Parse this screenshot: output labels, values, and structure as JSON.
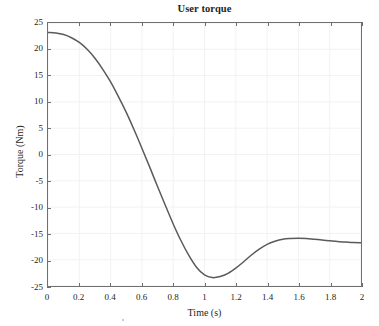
{
  "chart_data": {
    "type": "line",
    "title": "User torque",
    "xlabel": "Time (s)",
    "ylabel": "Torque (Nm)",
    "xlim": [
      0,
      2
    ],
    "ylim": [
      -25,
      25
    ],
    "grid": true,
    "legend": null,
    "line_color": "#5a5a5a",
    "line_width": 1.5,
    "xticks": [
      0,
      0.2,
      0.4,
      0.6,
      0.8,
      1,
      1.2,
      1.4,
      1.6,
      1.8,
      2
    ],
    "xtick_labels": [
      "0",
      "0.2",
      "0.4",
      "0.6",
      "0.8",
      "1",
      "1.2",
      "1.4",
      "1.6",
      "1.8",
      "2"
    ],
    "yticks": [
      25,
      20,
      15,
      10,
      5,
      0,
      -5,
      -10,
      -15,
      -20,
      -25
    ],
    "ytick_labels": [
      "25",
      "20",
      "15",
      "10",
      "5",
      "0",
      "-5",
      "-10",
      "-15",
      "-20",
      "-25"
    ],
    "series": [
      {
        "name": "User torque",
        "x": [
          0,
          0.05,
          0.1,
          0.15,
          0.2,
          0.25,
          0.3,
          0.35,
          0.4,
          0.45,
          0.5,
          0.55,
          0.6,
          0.65,
          0.7,
          0.75,
          0.8,
          0.85,
          0.9,
          0.95,
          1.0,
          1.05,
          1.1,
          1.15,
          1.2,
          1.25,
          1.3,
          1.35,
          1.4,
          1.45,
          1.5,
          1.55,
          1.6,
          1.65,
          1.7,
          1.75,
          1.8,
          1.85,
          1.9,
          1.95,
          2.0
        ],
        "y": [
          23.2,
          23.1,
          22.8,
          22.2,
          21.3,
          20.0,
          18.3,
          16.2,
          13.8,
          11.0,
          8.0,
          4.7,
          1.2,
          -2.4,
          -6.1,
          -9.7,
          -13.2,
          -16.4,
          -19.2,
          -21.5,
          -22.9,
          -23.4,
          -23.2,
          -22.6,
          -21.6,
          -20.4,
          -19.1,
          -18.0,
          -17.1,
          -16.5,
          -16.1,
          -15.95,
          -15.9,
          -15.95,
          -16.1,
          -16.25,
          -16.4,
          -16.55,
          -16.65,
          -16.75,
          -16.8
        ]
      }
    ],
    "annotations": {
      "start_value": 23.2,
      "zero_crossing_time": 0.63,
      "minimum": {
        "time": 1.05,
        "value": -23.4
      },
      "local_maximum": {
        "time": 1.58,
        "value": -15.9
      },
      "end_value": -16.8
    }
  },
  "figure": {
    "title": "User torque",
    "axis_color": "#6f6f6f",
    "grid_color": "#f2f2f2",
    "background": "#ffffff"
  }
}
